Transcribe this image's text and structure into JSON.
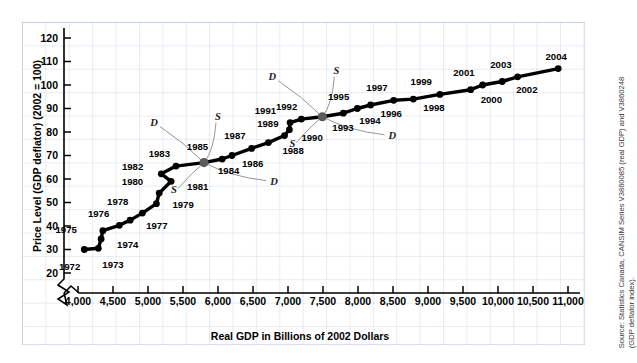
{
  "chart_data": {
    "type": "scatter",
    "title": "",
    "xlabel": "Real GDP in Billions of 2002 Dollars",
    "ylabel": "Price Level (GDP deflator) (2002 = 100)",
    "xlim": [
      3800,
      11100
    ],
    "ylim": [
      17,
      124
    ],
    "xticks": [
      "4,000",
      "4,500",
      "5,000",
      "5,500",
      "6,000",
      "6,500",
      "7,000",
      "7,500",
      "8,000",
      "8,500",
      "9,000",
      "9,500",
      "10,000",
      "10,500",
      "11,000"
    ],
    "xtick_values": [
      4000,
      4500,
      5000,
      5500,
      6000,
      6500,
      7000,
      7500,
      8000,
      8500,
      9000,
      9500,
      10000,
      10500,
      11000
    ],
    "yticks": [
      "20",
      "30",
      "40",
      "50",
      "60",
      "70",
      "80",
      "90",
      "100",
      "110",
      "120"
    ],
    "ytick_values": [
      20,
      30,
      40,
      50,
      60,
      70,
      80,
      90,
      100,
      110,
      120
    ],
    "grid": true,
    "axis_break_x": true,
    "axis_break_y": true,
    "legend_position": "none",
    "series": [
      {
        "name": "Canadian aggregate demand and supply path",
        "points": [
          {
            "label": "1972",
            "x": 4090,
            "y": 30.0,
            "lx": -4,
            "ly": 20
          },
          {
            "label": "1973",
            "x": 4290,
            "y": 30.5,
            "lx": 4,
            "ly": 20
          },
          {
            "label": "1974",
            "x": 4330,
            "y": 34.5,
            "lx": 16,
            "ly": 9
          },
          {
            "label": "1975",
            "x": 4355,
            "y": 38.0,
            "lx": -26,
            "ly": 2
          },
          {
            "label": "1976",
            "x": 4590,
            "y": 40.3,
            "lx": -10,
            "ly": -8
          },
          {
            "label": "1977",
            "x": 4745,
            "y": 42.5,
            "lx": 16,
            "ly": 9
          },
          {
            "label": "1978",
            "x": 4920,
            "y": 45.5,
            "lx": -14,
            "ly": -8
          },
          {
            "label": "1979",
            "x": 5120,
            "y": 49.5,
            "lx": 16,
            "ly": 4
          },
          {
            "label": "1980",
            "x": 5160,
            "y": 54.0,
            "lx": -16,
            "ly": -8
          },
          {
            "label": "1981",
            "x": 5330,
            "y": 59.0,
            "lx": 16,
            "ly": 9
          },
          {
            "label": "1982",
            "x": 5190,
            "y": 62.2,
            "lx": -18,
            "ly": -4
          },
          {
            "label": "1983",
            "x": 5400,
            "y": 65.5,
            "lx": -6,
            "ly": -9
          },
          {
            "label": "1984",
            "x": 5800,
            "y": 67.0,
            "lx": 14,
            "ly": 11,
            "highlight": true
          },
          {
            "label": "1985",
            "x": 6060,
            "y": 68.5,
            "lx": -14,
            "ly": -9
          },
          {
            "label": "1986",
            "x": 6200,
            "y": 70.0,
            "lx": 10,
            "ly": 11
          },
          {
            "label": "1987",
            "x": 6480,
            "y": 73.0,
            "lx": -6,
            "ly": -9
          },
          {
            "label": "1988",
            "x": 6720,
            "y": 75.5,
            "lx": 14,
            "ly": 11
          },
          {
            "label": "1989",
            "x": 6950,
            "y": 78.5,
            "lx": -6,
            "ly": -9
          },
          {
            "label": "1990",
            "x": 7020,
            "y": 81.0,
            "lx": 12,
            "ly": 11
          },
          {
            "label": "1991",
            "x": 7030,
            "y": 84.0,
            "lx": -14,
            "ly": -9
          },
          {
            "label": "1992",
            "x": 7190,
            "y": 85.5,
            "lx": -4,
            "ly": -9
          },
          {
            "label": "1993",
            "x": 7490,
            "y": 86.5,
            "lx": 10,
            "ly": 14,
            "highlight": true
          },
          {
            "label": "1994",
            "x": 7790,
            "y": 88.0,
            "lx": 16,
            "ly": 11
          },
          {
            "label": "1995",
            "x": 7990,
            "y": 90.0,
            "lx": -8,
            "ly": -9
          },
          {
            "label": "1996",
            "x": 8180,
            "y": 91.5,
            "lx": 10,
            "ly": 12
          },
          {
            "label": "1997",
            "x": 8510,
            "y": 93.5,
            "lx": -6,
            "ly": -9
          },
          {
            "label": "1998",
            "x": 8790,
            "y": 94.0,
            "lx": 10,
            "ly": 12
          },
          {
            "label": "1999",
            "x": 9170,
            "y": 96.0,
            "lx": -8,
            "ly": -9
          },
          {
            "label": "2000",
            "x": 9610,
            "y": 98.0,
            "lx": 10,
            "ly": 13
          },
          {
            "label": "2001",
            "x": 9780,
            "y": 100.0,
            "lx": -8,
            "ly": -9
          },
          {
            "label": "2002",
            "x": 10060,
            "y": 101.5,
            "lx": 14,
            "ly": 12
          },
          {
            "label": "2003",
            "x": 10280,
            "y": 103.5,
            "lx": -6,
            "ly": -9
          },
          {
            "label": "2004",
            "x": 10860,
            "y": 107.0,
            "lx": -2,
            "ly": -9
          }
        ]
      }
    ],
    "annotations": [
      {
        "text": "D",
        "at_year": "1984",
        "position": "upper-left"
      },
      {
        "text": "S",
        "at_year": "1984",
        "position": "upper-right"
      },
      {
        "text": "S",
        "at_year": "1984",
        "position": "lower-left"
      },
      {
        "text": "D",
        "at_year": "1984",
        "position": "lower-right"
      },
      {
        "text": "D",
        "at_year": "1993",
        "position": "upper-left"
      },
      {
        "text": "S",
        "at_year": "1993",
        "position": "upper-right"
      },
      {
        "text": "S",
        "at_year": "1993",
        "position": "lower-left"
      },
      {
        "text": "D",
        "at_year": "1993",
        "position": "lower-right"
      }
    ]
  },
  "source": {
    "line1": "Source: Statistics Canada, CANSIM Series V3860085 (real GDP) and V3860248",
    "line2": "(GDP deflator index)."
  }
}
